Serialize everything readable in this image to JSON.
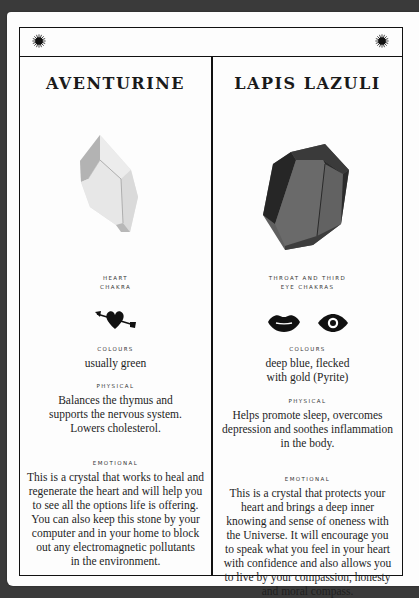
{
  "header": {
    "left_icon": "sun-icon",
    "center_icon": "crescent-moon-icon",
    "right_icon": "sun-icon"
  },
  "crystals": [
    {
      "name": "AVENTURINE",
      "image": "pale-green-crystal",
      "chakra": [
        "HEART",
        "CHAKRA"
      ],
      "chakra_icons": [
        "heart-with-arrow-icon"
      ],
      "colours_label": "COLOURS",
      "colours": [
        "usually green"
      ],
      "physical_label": "PHYSICAL",
      "physical": [
        "Balances the thymus and",
        "supports the nervous system.",
        "Lowers cholesterol."
      ],
      "emotional_label": "EMOTIONAL",
      "emotional": [
        "This is a crystal that works to heal and",
        "regenerate the heart and will help you",
        "to see all the options life is offering.",
        "You can also keep this stone by your",
        "computer and in your home to block",
        "out any electromagnetic pollutants",
        "in the environment."
      ]
    },
    {
      "name": "LAPIS LAZULI",
      "image": "deep-blue-crystal",
      "chakra": [
        "THROAT AND THIRD",
        "EYE CHAKRAS"
      ],
      "chakra_icons": [
        "lips-icon",
        "eye-icon"
      ],
      "colours_label": "COLOURS",
      "colours": [
        "deep blue, flecked",
        "with gold (Pyrite)"
      ],
      "physical_label": "PHYSICAL",
      "physical": [
        "Helps promote sleep, overcomes",
        "depression and soothes inflammation",
        "in the body."
      ],
      "emotional_label": "EMOTIONAL",
      "emotional": [
        "This is a crystal that protects your",
        "heart and brings a deep inner",
        "knowing and sense of oneness with",
        "the Universe. It will encourage you",
        "to speak what you feel in your heart",
        "with confidence and also allows you",
        "to live by your compassion, honesty",
        "and moral compass."
      ]
    }
  ],
  "colors": {
    "background": "#3a3a3a",
    "page": "#fdfdfd",
    "ink": "#111111",
    "aventurine_light": "#e6e6e6",
    "aventurine_shade": "#b5b5b5",
    "lapis_face": "#6b6b6b",
    "lapis_dark": "#2b2b2b"
  }
}
